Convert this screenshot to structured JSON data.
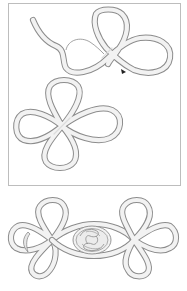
{
  "figure": {
    "type": "knot-tying illustration",
    "panels": [
      {
        "id": "step-1",
        "description": "Cord forming first loops of a cloverleaf knot, with arrow indicating direction"
      },
      {
        "id": "step-2",
        "description": "Completed four-loop cloverleaf knot"
      },
      {
        "id": "step-3",
        "description": "Finished frog closure with two cloverleaf knots joined by a central coiled button"
      }
    ],
    "colors": {
      "background": "#ffffff",
      "frame": "#bdbdbd",
      "cord_outline": "#8c8c8c",
      "cord_fill": "#f2f2f2",
      "arrow": "#222222"
    }
  }
}
